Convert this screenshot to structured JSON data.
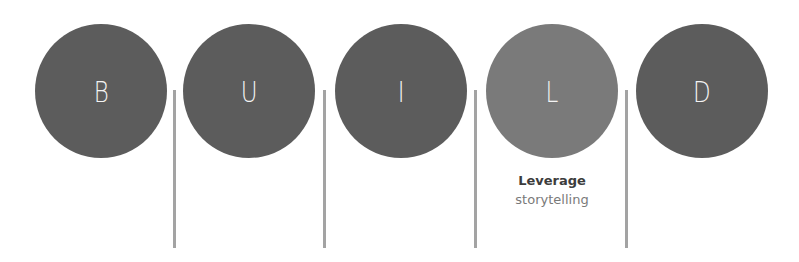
{
  "diagram": {
    "acronym": "BUILD",
    "colors": {
      "circle": "#5c5c5c",
      "circle_highlight": "#7a7a7a",
      "letter": "#f4f4f4",
      "separator": "#a3a3a3",
      "caption_title": "#3c3c3c",
      "caption_sub": "#7a7a7a"
    },
    "steps": [
      {
        "letter": "B"
      },
      {
        "letter": "U"
      },
      {
        "letter": "I"
      },
      {
        "letter": "L",
        "highlighted": true,
        "caption_title": "Leverage",
        "caption_sub": "storytelling"
      },
      {
        "letter": "D"
      }
    ]
  }
}
